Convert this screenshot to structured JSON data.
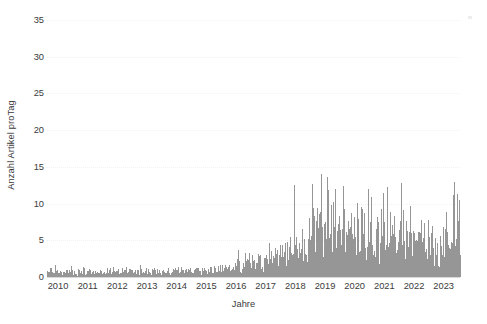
{
  "chart_data": {
    "type": "bar",
    "title": "",
    "xlabel": "Jahre",
    "ylabel": "Anzahl Artikel proTag",
    "ylim": [
      0,
      35
    ],
    "yticks": [
      0,
      5,
      10,
      15,
      20,
      25,
      30,
      35
    ],
    "xlim": [
      2010,
      2023.92
    ],
    "xticks": [
      2010,
      2011,
      2012,
      2013,
      2014,
      2015,
      2016,
      2017,
      2018,
      2019,
      2020,
      2021,
      2022,
      2023
    ],
    "xticklabels": [
      "2010",
      "2011",
      "2012",
      "2013",
      "2014",
      "2015",
      "2016",
      "2017",
      "2018",
      "2019",
      "2020",
      "2021",
      "2022",
      "2023"
    ],
    "grid": "horizontal-dotted-faint",
    "legend": "none",
    "bar_color": "#969696",
    "series_name": "Artikel pro Tag",
    "x": [
      2010.02,
      2010.06,
      2010.1,
      2010.14,
      2010.18,
      2010.22,
      2010.26,
      2010.3,
      2010.34,
      2010.38,
      2010.42,
      2010.46,
      2010.5,
      2010.54,
      2010.58,
      2010.62,
      2010.66,
      2010.7,
      2010.74,
      2010.78,
      2010.82,
      2010.86,
      2010.9,
      2010.94,
      2011.02,
      2011.06,
      2011.1,
      2011.14,
      2011.18,
      2011.22,
      2011.26,
      2011.3,
      2011.34,
      2011.38,
      2011.42,
      2011.46,
      2011.5,
      2011.54,
      2011.58,
      2011.62,
      2011.66,
      2011.7,
      2011.74,
      2011.78,
      2011.82,
      2011.86,
      2011.9,
      2011.94,
      2012.02,
      2012.06,
      2012.1,
      2012.14,
      2012.18,
      2012.22,
      2012.26,
      2012.3,
      2012.34,
      2012.38,
      2012.42,
      2012.46,
      2012.5,
      2012.54,
      2012.58,
      2012.62,
      2012.66,
      2012.7,
      2012.74,
      2012.78,
      2012.82,
      2012.86,
      2012.9,
      2012.94,
      2013.02,
      2013.06,
      2013.1,
      2013.14,
      2013.18,
      2013.22,
      2013.26,
      2013.3,
      2013.34,
      2013.38,
      2013.42,
      2013.46,
      2013.5,
      2013.54,
      2013.58,
      2013.62,
      2013.66,
      2013.7,
      2013.74,
      2013.78,
      2013.82,
      2013.86,
      2013.9,
      2013.94,
      2014.02,
      2014.06,
      2014.1,
      2014.14,
      2014.18,
      2014.22,
      2014.26,
      2014.3,
      2014.34,
      2014.38,
      2014.42,
      2014.46,
      2014.5,
      2014.54,
      2014.58,
      2014.62,
      2014.66,
      2014.7,
      2014.74,
      2014.78,
      2014.82,
      2014.86,
      2014.9,
      2014.94,
      2015.02,
      2015.06,
      2015.1,
      2015.14,
      2015.18,
      2015.22,
      2015.26,
      2015.3,
      2015.34,
      2015.38,
      2015.42,
      2015.46,
      2015.5,
      2015.54,
      2015.58,
      2015.62,
      2015.66,
      2015.7,
      2015.74,
      2015.78,
      2015.82,
      2015.86,
      2015.9,
      2015.94,
      2016.02,
      2016.06,
      2016.1,
      2016.14,
      2016.18,
      2016.22,
      2016.26,
      2016.3,
      2016.34,
      2016.38,
      2016.42,
      2016.46,
      2016.5,
      2016.54,
      2016.58,
      2016.62,
      2016.66,
      2016.7,
      2016.74,
      2016.78,
      2016.82,
      2016.86,
      2016.9,
      2016.94,
      2017.02,
      2017.06,
      2017.1,
      2017.14,
      2017.18,
      2017.22,
      2017.26,
      2017.3,
      2017.34,
      2017.38,
      2017.42,
      2017.46,
      2017.5,
      2017.54,
      2017.58,
      2017.62,
      2017.66,
      2017.7,
      2017.74,
      2017.78,
      2017.82,
      2017.86,
      2017.9,
      2017.94,
      2018.02,
      2018.06,
      2018.1,
      2018.14,
      2018.18,
      2018.22,
      2018.26,
      2018.3,
      2018.34,
      2018.38,
      2018.42,
      2018.46,
      2018.5,
      2018.54,
      2018.58,
      2018.62,
      2018.66,
      2018.7,
      2018.74,
      2018.78,
      2018.82,
      2018.86,
      2018.9,
      2018.94,
      2019.02,
      2019.06,
      2019.1,
      2019.14,
      2019.18,
      2019.22,
      2019.26,
      2019.3,
      2019.34,
      2019.38,
      2019.42,
      2019.46,
      2019.5,
      2019.54,
      2019.58,
      2019.62,
      2019.66,
      2019.7,
      2019.74,
      2019.78,
      2019.82,
      2019.86,
      2019.9,
      2019.94,
      2020.02,
      2020.06,
      2020.1,
      2020.14,
      2020.18,
      2020.22,
      2020.26,
      2020.3,
      2020.34,
      2020.38,
      2020.42,
      2020.46,
      2020.5,
      2020.54,
      2020.58,
      2020.62,
      2020.66,
      2020.7,
      2020.74,
      2020.78,
      2020.82,
      2020.86,
      2020.9,
      2020.94,
      2021.02,
      2021.06,
      2021.1,
      2021.14,
      2021.18,
      2021.22,
      2021.26,
      2021.3,
      2021.34,
      2021.38,
      2021.42,
      2021.46,
      2021.5,
      2021.54,
      2021.58,
      2021.62,
      2021.66,
      2021.7,
      2021.74,
      2021.78,
      2021.82,
      2021.86,
      2021.9,
      2021.94,
      2022.02,
      2022.06,
      2022.1,
      2022.14,
      2022.18,
      2022.22,
      2022.26,
      2022.3,
      2022.34,
      2022.38,
      2022.42,
      2022.46,
      2022.5,
      2022.54,
      2022.58,
      2022.62,
      2022.66,
      2022.7,
      2022.74,
      2022.78,
      2022.82,
      2022.86,
      2022.9,
      2022.94,
      2023.02,
      2023.06,
      2023.1,
      2023.14,
      2023.18,
      2023.22,
      2023.26,
      2023.3,
      2023.34,
      2023.38,
      2023.42,
      2023.46,
      2023.5,
      2023.54,
      2023.58,
      2023.62,
      2023.66,
      2023.7,
      2023.74,
      2023.78,
      2023.82,
      2023.86
    ],
    "values": [
      1.0,
      0.6,
      1.4,
      0.8,
      1.2,
      0.5,
      1.6,
      0.9,
      1.1,
      0.7,
      1.3,
      0.6,
      1.0,
      0.8,
      1.5,
      0.7,
      1.2,
      0.9,
      1.0,
      0.6,
      1.4,
      0.8,
      1.1,
      0.7,
      0.9,
      1.3,
      0.7,
      1.1,
      1.6,
      0.8,
      1.2,
      0.6,
      1.0,
      1.4,
      0.9,
      0.7,
      1.3,
      1.1,
      0.8,
      1.5,
      0.9,
      1.2,
      0.7,
      1.0,
      1.3,
      0.8,
      1.1,
      0.9,
      1.2,
      0.8,
      1.4,
      1.0,
      0.7,
      1.3,
      0.9,
      1.6,
      1.1,
      0.8,
      1.2,
      1.0,
      0.7,
      1.4,
      0.9,
      1.1,
      1.3,
      0.8,
      1.0,
      1.5,
      0.9,
      1.2,
      0.7,
      1.1,
      1.0,
      1.3,
      0.8,
      1.5,
      1.1,
      0.9,
      1.2,
      0.7,
      1.4,
      1.0,
      0.8,
      1.3,
      1.1,
      1.6,
      0.9,
      1.2,
      0.8,
      1.0,
      1.4,
      1.1,
      0.7,
      1.3,
      0.9,
      1.2,
      1.1,
      0.9,
      1.4,
      1.2,
      0.8,
      1.5,
      1.0,
      1.3,
      0.9,
      1.6,
      1.1,
      0.8,
      1.2,
      1.4,
      1.0,
      0.9,
      1.3,
      1.1,
      1.7,
      0.9,
      1.2,
      1.0,
      1.4,
      1.1,
      1.3,
      1.0,
      1.6,
      1.2,
      0.9,
      1.5,
      1.1,
      1.8,
      1.3,
      1.0,
      1.4,
      1.2,
      2.0,
      1.1,
      1.5,
      1.3,
      1.0,
      1.7,
      1.2,
      1.4,
      1.1,
      1.9,
      1.3,
      1.6,
      1.8,
      1.4,
      2.2,
      1.6,
      2.0,
      1.3,
      2.6,
      1.7,
      2.1,
      1.5,
      8.0,
      1.9,
      2.3,
      1.6,
      2.8,
      2.0,
      3.4,
      1.8,
      2.5,
      2.1,
      3.0,
      1.9,
      2.7,
      2.3,
      2.6,
      3.2,
      2.1,
      4.0,
      2.8,
      2.3,
      5.2,
      3.0,
      2.5,
      3.8,
      2.7,
      6.1,
      3.3,
      2.6,
      4.5,
      3.1,
      2.8,
      5.5,
      3.6,
      2.9,
      4.8,
      3.4,
      7.0,
      3.8,
      4.2,
      3.0,
      6.5,
      4.6,
      3.5,
      8.2,
      5.0,
      3.8,
      11.5,
      5.4,
      4.1,
      7.8,
      4.8,
      3.9,
      14.0,
      6.2,
      4.5,
      9.5,
      5.6,
      4.2,
      12.8,
      6.8,
      5.0,
      18.5,
      9.0,
      5.5,
      30.0,
      8.5,
      6.0,
      22.0,
      10.5,
      6.5,
      26.5,
      9.5,
      7.0,
      19.0,
      8.0,
      6.2,
      24.0,
      11.0,
      7.5,
      16.5,
      9.2,
      6.8,
      21.0,
      10.0,
      7.2,
      14.5,
      8.5,
      6.5,
      17.0,
      9.0,
      7.0,
      12.5,
      8.0,
      6.0,
      15.5,
      9.5,
      7.5,
      11.0,
      8.2,
      6.5,
      13.5,
      10.0,
      7.8,
      9.5,
      7.2,
      6.0,
      12.0,
      8.8,
      7.0,
      10.5,
      7.5,
      6.2,
      14.0,
      8.0,
      6.5,
      10.0,
      7.8,
      6.0,
      15.5,
      9.0,
      7.0,
      11.5,
      8.2,
      6.5,
      9.5,
      7.0,
      5.8,
      13.0,
      8.5,
      6.8,
      10.5,
      7.5,
      6.2,
      12.0,
      7.0,
      5.5,
      9.5,
      7.8,
      6.0,
      11.0,
      8.0,
      6.2,
      9.0,
      6.8,
      5.5,
      10.5,
      7.2,
      5.8,
      8.5,
      6.5,
      5.2,
      9.8,
      7.0,
      5.5,
      8.0,
      6.2,
      5.0,
      9.0,
      6.0,
      5.2,
      7.5,
      6.5,
      5.0,
      8.0,
      6.2,
      5.5,
      7.0,
      6.8,
      5.8,
      9.5,
      7.2,
      6.0,
      11.0,
      8.5,
      7.0,
      13.0,
      9.0,
      7.5,
      17.5,
      10.0
    ]
  },
  "axes": {
    "y_title": "Anzahl Artikel proTag",
    "x_title": "Jahre",
    "y_tick_labels": [
      "0",
      "5",
      "10",
      "15",
      "20",
      "25",
      "30",
      "35"
    ],
    "x_tick_labels": [
      "2010",
      "2011",
      "2012",
      "2013",
      "2014",
      "2015",
      "2016",
      "2017",
      "2018",
      "2019",
      "2020",
      "2021",
      "2022",
      "2023"
    ]
  }
}
